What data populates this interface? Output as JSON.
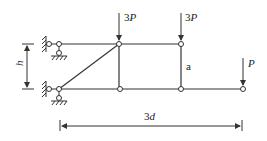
{
  "diagram": {
    "type": "truss",
    "loads": [
      {
        "id": "load-top-middle",
        "label_coef": "3",
        "label_var": "P",
        "x": 119
      },
      {
        "id": "load-top-right",
        "label_coef": "3",
        "label_var": "P",
        "x": 181
      },
      {
        "id": "load-bottom-right",
        "label_coef": "",
        "label_var": "P",
        "x": 243
      }
    ],
    "member_label": "a",
    "height_label": "h",
    "span_label_coef": "3",
    "span_label_var": "d",
    "colors": {
      "line": "#333333",
      "background": "#ffffff"
    }
  }
}
